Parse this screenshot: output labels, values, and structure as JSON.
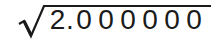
{
  "expression": {
    "operator": "square-root",
    "radicand_text": "2.000000",
    "radicand_chars": [
      "2",
      ".",
      "0",
      "0",
      "0",
      "0",
      "0",
      "0"
    ],
    "color": "#1a1a1a",
    "background": "#ffffff"
  }
}
